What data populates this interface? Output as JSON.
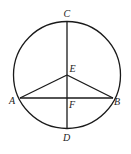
{
  "diagram": {
    "type": "geometry",
    "points": {
      "A": {
        "label": "A"
      },
      "B": {
        "label": "B"
      },
      "C": {
        "label": "C"
      },
      "D": {
        "label": "D"
      },
      "E": {
        "label": "E"
      },
      "F": {
        "label": "F"
      }
    },
    "segments": [
      {
        "from": "C",
        "to": "D"
      },
      {
        "from": "A",
        "to": "B"
      },
      {
        "from": "A",
        "to": "E"
      },
      {
        "from": "E",
        "to": "B"
      }
    ],
    "colors": {
      "line": "#1a1a1a",
      "label": "#222222",
      "background": "#ffffff"
    }
  }
}
